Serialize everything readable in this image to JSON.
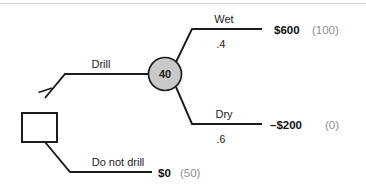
{
  "diagram": {
    "type": "decision-tree",
    "colors": {
      "line": "#1b1b1b",
      "chance_node_fill": "#c9c9c9",
      "chance_node_stroke": "#1b1b1b",
      "decision_node_fill": "#ffffff",
      "decision_node_stroke": "#1b1b1b",
      "payoff_text": "#111111",
      "rollback_text": "#8d8d8d",
      "top_rule": "#d8d8d8"
    },
    "decision_node": {
      "label": "",
      "shape": "square"
    },
    "chance_node": {
      "label": "40",
      "shape": "circle"
    },
    "branches": [
      {
        "id": "drill",
        "label": "Drill",
        "probability": "",
        "payoff": "",
        "rollback": "",
        "pruned": true
      },
      {
        "id": "wet",
        "label": "Wet",
        "probability": ".4",
        "payoff": "$600",
        "rollback": "(100)",
        "pruned": false
      },
      {
        "id": "dry",
        "label": "Dry",
        "probability": ".6",
        "payoff": "–$200",
        "rollback": "(0)",
        "pruned": false
      },
      {
        "id": "do-not-drill",
        "label": "Do not drill",
        "probability": "",
        "payoff": "$0",
        "rollback": "(50)",
        "pruned": false
      }
    ]
  }
}
